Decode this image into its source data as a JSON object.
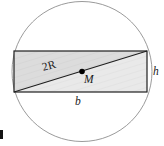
{
  "figure": {
    "labels": {
      "diagonal": "2R",
      "center": "M",
      "base": "b",
      "height": "h"
    },
    "colors": {
      "stroke": "#1a1a1a",
      "circle_stroke": "#8a8a8a",
      "rect_fill": "#dcdcdc",
      "rect_fill_lower": "#ededed",
      "background": "#ffffff",
      "point": "#000000"
    },
    "geometry": {
      "circle": {
        "cx": 82,
        "cy": 71.5,
        "r": 70
      },
      "rect": {
        "x": 14,
        "y": 51,
        "width": 133,
        "height": 41
      },
      "diagonal": {
        "x1": 14,
        "y1": 92,
        "x2": 147,
        "y2": 51
      },
      "center_point": {
        "cx": 82,
        "cy": 71.5,
        "r": 2.6
      }
    }
  }
}
